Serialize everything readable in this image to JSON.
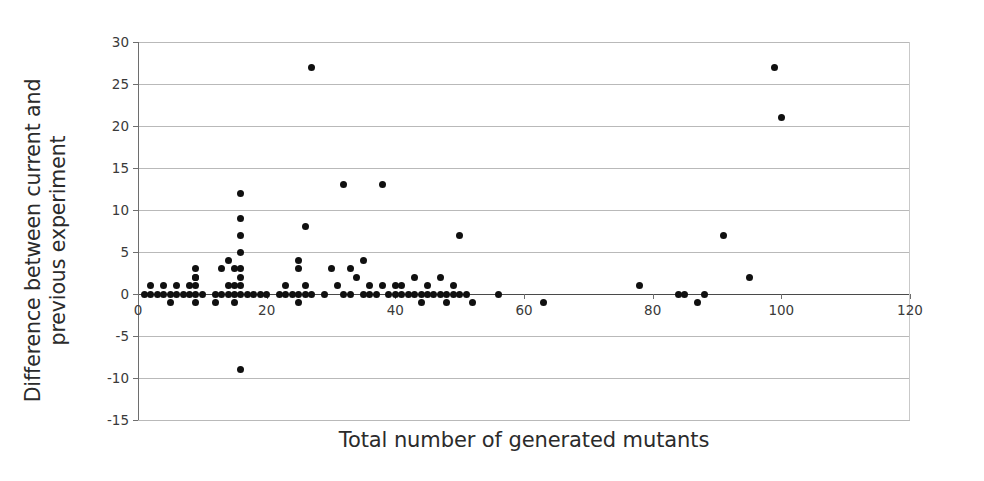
{
  "chart_data": {
    "type": "scatter",
    "title": "",
    "xlabel": "Total number of generated mutants",
    "ylabel_line1": "Difference between current and",
    "ylabel_line2": "previous experiment",
    "ylabel": "Difference between current and previous experiment",
    "xlim": [
      0,
      120
    ],
    "ylim": [
      -15,
      30
    ],
    "xticks": [
      0,
      20,
      40,
      60,
      80,
      100,
      120
    ],
    "yticks": [
      -15,
      -10,
      -5,
      0,
      5,
      10,
      15,
      20,
      25,
      30
    ],
    "grid": "horizontal",
    "legend": "none",
    "marker": "filled-circle",
    "marker_color": "#101010",
    "grid_color": "#b9b9b9",
    "axis_color": "#4a4a4a",
    "background": "#ffffff",
    "points": [
      [
        1,
        0
      ],
      [
        2,
        0
      ],
      [
        2,
        1
      ],
      [
        3,
        0
      ],
      [
        4,
        0
      ],
      [
        4,
        1
      ],
      [
        5,
        0
      ],
      [
        5,
        -1
      ],
      [
        6,
        0
      ],
      [
        6,
        1
      ],
      [
        7,
        0
      ],
      [
        8,
        0
      ],
      [
        8,
        1
      ],
      [
        9,
        0
      ],
      [
        9,
        2
      ],
      [
        9,
        2
      ],
      [
        9,
        3
      ],
      [
        9,
        1
      ],
      [
        9,
        -1
      ],
      [
        10,
        0
      ],
      [
        12,
        0
      ],
      [
        12,
        -1
      ],
      [
        13,
        0
      ],
      [
        13,
        3
      ],
      [
        14,
        0
      ],
      [
        14,
        1
      ],
      [
        14,
        4
      ],
      [
        15,
        0
      ],
      [
        15,
        1
      ],
      [
        15,
        -1
      ],
      [
        15,
        3
      ],
      [
        16,
        0
      ],
      [
        16,
        12
      ],
      [
        16,
        9
      ],
      [
        16,
        7
      ],
      [
        16,
        5
      ],
      [
        16,
        2
      ],
      [
        16,
        1
      ],
      [
        16,
        3
      ],
      [
        16,
        -9
      ],
      [
        17,
        0
      ],
      [
        18,
        0
      ],
      [
        19,
        0
      ],
      [
        20,
        0
      ],
      [
        22,
        0
      ],
      [
        23,
        0
      ],
      [
        23,
        1
      ],
      [
        24,
        0
      ],
      [
        25,
        0
      ],
      [
        25,
        3
      ],
      [
        25,
        4
      ],
      [
        25,
        -1
      ],
      [
        26,
        0
      ],
      [
        26,
        1
      ],
      [
        26,
        8
      ],
      [
        27,
        0
      ],
      [
        27,
        27
      ],
      [
        29,
        0
      ],
      [
        30,
        3
      ],
      [
        31,
        1
      ],
      [
        32,
        13
      ],
      [
        32,
        0
      ],
      [
        33,
        3
      ],
      [
        33,
        0
      ],
      [
        34,
        2
      ],
      [
        35,
        4
      ],
      [
        35,
        0
      ],
      [
        36,
        1
      ],
      [
        36,
        0
      ],
      [
        37,
        0
      ],
      [
        38,
        13
      ],
      [
        38,
        1
      ],
      [
        39,
        0
      ],
      [
        40,
        1
      ],
      [
        40,
        0
      ],
      [
        41,
        0
      ],
      [
        41,
        1
      ],
      [
        42,
        0
      ],
      [
        43,
        2
      ],
      [
        43,
        0
      ],
      [
        44,
        0
      ],
      [
        44,
        -1
      ],
      [
        45,
        1
      ],
      [
        45,
        0
      ],
      [
        46,
        0
      ],
      [
        47,
        2
      ],
      [
        47,
        0
      ],
      [
        48,
        0
      ],
      [
        48,
        -1
      ],
      [
        49,
        1
      ],
      [
        49,
        0
      ],
      [
        50,
        7
      ],
      [
        50,
        0
      ],
      [
        51,
        0
      ],
      [
        52,
        -1
      ],
      [
        56,
        0
      ],
      [
        63,
        -1
      ],
      [
        78,
        1
      ],
      [
        84,
        0
      ],
      [
        85,
        0
      ],
      [
        87,
        -1
      ],
      [
        88,
        0
      ],
      [
        91,
        7
      ],
      [
        95,
        2
      ],
      [
        99,
        27
      ],
      [
        100,
        21
      ]
    ]
  }
}
